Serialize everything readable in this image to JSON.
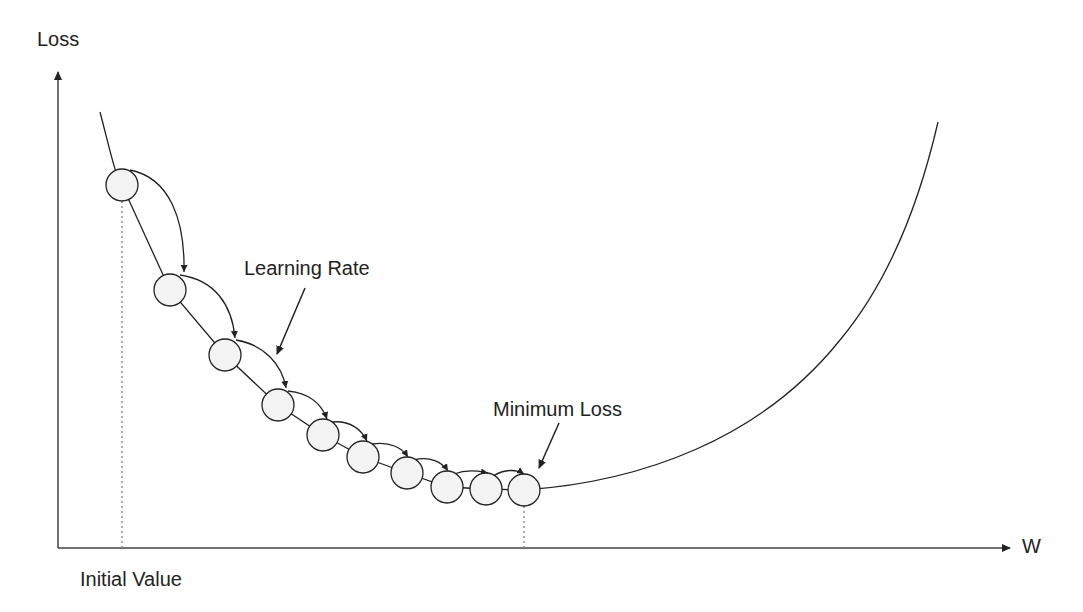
{
  "diagram": {
    "y_axis_label": "Loss",
    "x_axis_label": "W",
    "labels": {
      "learning_rate": "Learning Rate",
      "minimum_loss": "Minimum Loss",
      "initial_value": "Initial Value"
    },
    "steps": [
      {
        "x": 122,
        "y": 185
      },
      {
        "x": 170,
        "y": 290
      },
      {
        "x": 225,
        "y": 355
      },
      {
        "x": 278,
        "y": 405
      },
      {
        "x": 323,
        "y": 435
      },
      {
        "x": 363,
        "y": 457
      },
      {
        "x": 407,
        "y": 473
      },
      {
        "x": 447,
        "y": 487
      },
      {
        "x": 486,
        "y": 489
      },
      {
        "x": 524,
        "y": 490
      }
    ],
    "step_radius": 16,
    "colors": {
      "line": "#222222",
      "circle_fill": "#f2f2f2",
      "dotted": "#777777"
    }
  }
}
